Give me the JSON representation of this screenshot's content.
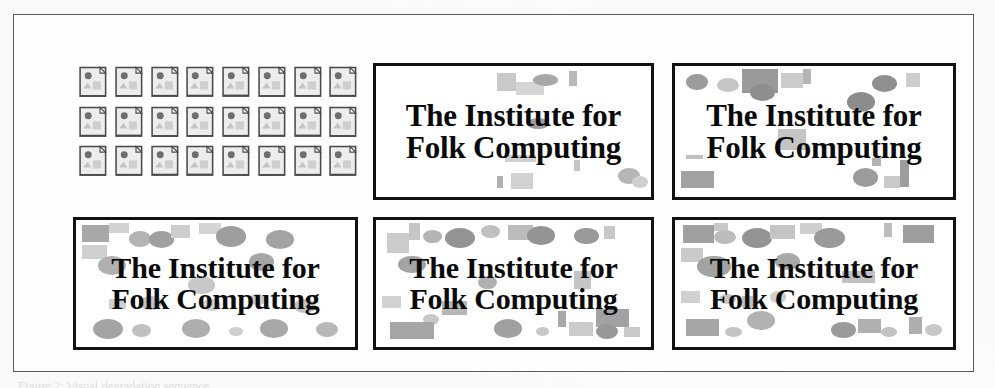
{
  "figure": {
    "caption": "Figure 2: Visual degradation sequence",
    "frame_color": "#5a5a5a",
    "page_background": "#fdfdfc"
  },
  "icon_grid": {
    "label": "image file icon grid",
    "icon_name": "image-document-icon",
    "columns": 8,
    "rows": 3,
    "count": 24,
    "icon_fill": "#ededed",
    "icon_outline": "#4a4a4a",
    "icon_accent": "#6e6e6e"
  },
  "posters": [
    {
      "id": "poster-a",
      "line1": "The Institute for",
      "line2": "Folk Computing",
      "noise_level": 1,
      "border_color": "#111111",
      "background": "#ffffff"
    },
    {
      "id": "poster-b",
      "line1": "The Institute for",
      "line2": "Folk Computing",
      "noise_level": 2,
      "border_color": "#111111",
      "background": "#ffffff"
    },
    {
      "id": "poster-c",
      "line1": "The Institute for",
      "line2": "Folk Computing",
      "noise_level": 3,
      "border_color": "#111111",
      "background": "#ffffff"
    },
    {
      "id": "poster-d",
      "line1": "The Institute for",
      "line2": "Folk Computing",
      "noise_level": 4,
      "border_color": "#111111",
      "background": "#ffffff"
    },
    {
      "id": "poster-e",
      "line1": "The Institute for",
      "line2": "Folk Computing",
      "noise_level": 5,
      "border_color": "#111111",
      "background": "#ffffff"
    }
  ],
  "noise_palette": {
    "light": "#d8d8d8",
    "medium": "#b4b4b4",
    "dark": "#9a9a9a",
    "darker": "#808080"
  },
  "noise_shapes": {
    "poster-a": [
      {
        "t": "sq",
        "x": 44,
        "y": 5,
        "w": 7,
        "h": 14,
        "c": "#c9c9c9"
      },
      {
        "t": "sq",
        "x": 51,
        "y": 12,
        "w": 10,
        "h": 10,
        "c": "#d5d5d5"
      },
      {
        "t": "ci",
        "x": 57,
        "y": 6,
        "w": 9,
        "h": 9,
        "c": "#a8a8a8"
      },
      {
        "t": "sq",
        "x": 70,
        "y": 4,
        "w": 3,
        "h": 11,
        "c": "#b9b9b9"
      },
      {
        "t": "ci",
        "x": 55,
        "y": 40,
        "w": 8,
        "h": 8,
        "c": "#9e9e9e"
      },
      {
        "t": "sq",
        "x": 47,
        "y": 68,
        "w": 11,
        "h": 5,
        "c": "#cfcfcf"
      },
      {
        "t": "sq",
        "x": 49,
        "y": 82,
        "w": 8,
        "h": 12,
        "c": "#d2d2d2"
      },
      {
        "t": "sq",
        "x": 44,
        "y": 84,
        "w": 2,
        "h": 9,
        "c": "#b0b0b0"
      },
      {
        "t": "ci",
        "x": 88,
        "y": 78,
        "w": 8,
        "h": 12,
        "c": "#b6b6b6"
      },
      {
        "t": "sq",
        "x": 72,
        "y": 72,
        "w": 2,
        "h": 8,
        "c": "#c4c4c4"
      },
      {
        "t": "ci",
        "x": 93,
        "y": 84,
        "w": 6,
        "h": 9,
        "c": "#d0d0d0"
      }
    ],
    "poster-b": [
      {
        "t": "ci",
        "x": 4,
        "y": 6,
        "w": 8,
        "h": 12,
        "c": "#9c9c9c"
      },
      {
        "t": "ci",
        "x": 15,
        "y": 9,
        "w": 8,
        "h": 11,
        "c": "#c6c6c6"
      },
      {
        "t": "sq",
        "x": 24,
        "y": 2,
        "w": 13,
        "h": 19,
        "c": "#9a9a9a"
      },
      {
        "t": "ci",
        "x": 27,
        "y": 14,
        "w": 9,
        "h": 13,
        "c": "#8e8e8e"
      },
      {
        "t": "sq",
        "x": 38,
        "y": 5,
        "w": 8,
        "h": 12,
        "c": "#cccccc"
      },
      {
        "t": "sq",
        "x": 46,
        "y": 2,
        "w": 3,
        "h": 12,
        "c": "#b4b4b4"
      },
      {
        "t": "ci",
        "x": 62,
        "y": 20,
        "w": 10,
        "h": 15,
        "c": "#8c8c8c"
      },
      {
        "t": "ci",
        "x": 71,
        "y": 7,
        "w": 9,
        "h": 13,
        "c": "#8f8f8f"
      },
      {
        "t": "sq",
        "x": 83,
        "y": 5,
        "w": 5,
        "h": 11,
        "c": "#cdcdcd"
      },
      {
        "t": "sq",
        "x": 37,
        "y": 48,
        "w": 10,
        "h": 16,
        "c": "#c4c4c4"
      },
      {
        "t": "sq",
        "x": 4,
        "y": 68,
        "w": 6,
        "h": 3,
        "c": "#c0c0c0"
      },
      {
        "t": "sq",
        "x": 2,
        "y": 80,
        "w": 12,
        "h": 13,
        "c": "#a2a2a2"
      },
      {
        "t": "ci",
        "x": 64,
        "y": 78,
        "w": 9,
        "h": 14,
        "c": "#9b9b9b"
      },
      {
        "t": "sq",
        "x": 75,
        "y": 84,
        "w": 6,
        "h": 9,
        "c": "#c9c9c9"
      },
      {
        "t": "sq",
        "x": 81,
        "y": 72,
        "w": 3,
        "h": 20,
        "c": "#9d9d9d"
      },
      {
        "t": "sq",
        "x": 71,
        "y": 70,
        "w": 3,
        "h": 6,
        "c": "#b2b2b2"
      }
    ],
    "poster-c": [
      {
        "t": "sq",
        "x": 2,
        "y": 4,
        "w": 10,
        "h": 13,
        "c": "#a8a8a8"
      },
      {
        "t": "sq",
        "x": 12,
        "y": 2,
        "w": 7,
        "h": 8,
        "c": "#d2d2d2"
      },
      {
        "t": "ci",
        "x": 19,
        "y": 9,
        "w": 8,
        "h": 12,
        "c": "#b4b4b4"
      },
      {
        "t": "ci",
        "x": 26,
        "y": 9,
        "w": 9,
        "h": 13,
        "c": "#a0a0a0"
      },
      {
        "t": "sq",
        "x": 34,
        "y": 4,
        "w": 7,
        "h": 10,
        "c": "#cdcdcd"
      },
      {
        "t": "sq",
        "x": 44,
        "y": 2,
        "w": 8,
        "h": 9,
        "c": "#d4d4d4"
      },
      {
        "t": "ci",
        "x": 50,
        "y": 5,
        "w": 11,
        "h": 16,
        "c": "#9e9e9e"
      },
      {
        "t": "ci",
        "x": 68,
        "y": 8,
        "w": 10,
        "h": 15,
        "c": "#a3a3a3"
      },
      {
        "t": "sq",
        "x": 2,
        "y": 20,
        "w": 9,
        "h": 11,
        "c": "#cfcfcf"
      },
      {
        "t": "ci",
        "x": 8,
        "y": 28,
        "w": 10,
        "h": 15,
        "c": "#b0b0b0"
      },
      {
        "t": "ci",
        "x": 62,
        "y": 26,
        "w": 9,
        "h": 14,
        "c": "#a6a6a6"
      },
      {
        "t": "ci",
        "x": 40,
        "y": 44,
        "w": 10,
        "h": 14,
        "c": "#c8c8c8"
      },
      {
        "t": "sq",
        "x": 12,
        "y": 62,
        "w": 6,
        "h": 8,
        "c": "#d0d0d0"
      },
      {
        "t": "ci",
        "x": 23,
        "y": 60,
        "w": 8,
        "h": 11,
        "c": "#c4c4c4"
      },
      {
        "t": "ci",
        "x": 45,
        "y": 62,
        "w": 7,
        "h": 10,
        "c": "#d2d2d2"
      },
      {
        "t": "ci",
        "x": 62,
        "y": 58,
        "w": 6,
        "h": 9,
        "c": "#cacaca"
      },
      {
        "t": "ci",
        "x": 78,
        "y": 62,
        "w": 8,
        "h": 11,
        "c": "#c2c2c2"
      },
      {
        "t": "ci",
        "x": 6,
        "y": 78,
        "w": 11,
        "h": 16,
        "c": "#a4a4a4"
      },
      {
        "t": "ci",
        "x": 20,
        "y": 82,
        "w": 7,
        "h": 10,
        "c": "#c0c0c0"
      },
      {
        "t": "ci",
        "x": 38,
        "y": 78,
        "w": 10,
        "h": 15,
        "c": "#aeaeae"
      },
      {
        "t": "ci",
        "x": 55,
        "y": 84,
        "w": 5,
        "h": 7,
        "c": "#cfcfcf"
      },
      {
        "t": "ci",
        "x": 66,
        "y": 78,
        "w": 10,
        "h": 15,
        "c": "#a8a8a8"
      },
      {
        "t": "ci",
        "x": 86,
        "y": 80,
        "w": 8,
        "h": 12,
        "c": "#b8b8b8"
      }
    ],
    "poster-d": [
      {
        "t": "sq",
        "x": 12,
        "y": 2,
        "w": 4,
        "h": 14,
        "c": "#c6c6c6"
      },
      {
        "t": "ci",
        "x": 17,
        "y": 8,
        "w": 7,
        "h": 10,
        "c": "#b4b4b4"
      },
      {
        "t": "sq",
        "x": 4,
        "y": 10,
        "w": 8,
        "h": 16,
        "c": "#cccccc"
      },
      {
        "t": "ci",
        "x": 25,
        "y": 6,
        "w": 11,
        "h": 16,
        "c": "#949494"
      },
      {
        "t": "ci",
        "x": 38,
        "y": 4,
        "w": 7,
        "h": 10,
        "c": "#c0c0c0"
      },
      {
        "t": "sq",
        "x": 48,
        "y": 4,
        "w": 9,
        "h": 12,
        "c": "#bcbcbc"
      },
      {
        "t": "ci",
        "x": 55,
        "y": 5,
        "w": 10,
        "h": 15,
        "c": "#949494"
      },
      {
        "t": "ci",
        "x": 72,
        "y": 6,
        "w": 9,
        "h": 13,
        "c": "#9a9a9a"
      },
      {
        "t": "sq",
        "x": 83,
        "y": 5,
        "w": 4,
        "h": 10,
        "c": "#c8c8c8"
      },
      {
        "t": "ci",
        "x": 8,
        "y": 28,
        "w": 10,
        "h": 14,
        "c": "#a4a4a4"
      },
      {
        "t": "ci",
        "x": 37,
        "y": 44,
        "w": 7,
        "h": 10,
        "c": "#b0b0b0"
      },
      {
        "t": "sq",
        "x": 72,
        "y": 40,
        "w": 6,
        "h": 14,
        "c": "#c4c4c4"
      },
      {
        "t": "sq",
        "x": 2,
        "y": 60,
        "w": 7,
        "h": 9,
        "c": "#d2d2d2"
      },
      {
        "t": "sq",
        "x": 24,
        "y": 64,
        "w": 9,
        "h": 11,
        "c": "#b6b6b6"
      },
      {
        "t": "ci",
        "x": 17,
        "y": 74,
        "w": 6,
        "h": 9,
        "c": "#c8c8c8"
      },
      {
        "t": "sq",
        "x": 5,
        "y": 80,
        "w": 16,
        "h": 14,
        "c": "#a6a6a6"
      },
      {
        "t": "ci",
        "x": 43,
        "y": 78,
        "w": 10,
        "h": 15,
        "c": "#a0a0a0"
      },
      {
        "t": "ci",
        "x": 58,
        "y": 84,
        "w": 5,
        "h": 7,
        "c": "#c8c8c8"
      },
      {
        "t": "sq",
        "x": 66,
        "y": 72,
        "w": 3,
        "h": 12,
        "c": "#a8a8a8"
      },
      {
        "t": "sq",
        "x": 70,
        "y": 80,
        "w": 9,
        "h": 11,
        "c": "#cbcbcb"
      },
      {
        "t": "sq",
        "x": 80,
        "y": 70,
        "w": 12,
        "h": 14,
        "c": "#a2a2a2"
      },
      {
        "t": "ci",
        "x": 80,
        "y": 82,
        "w": 8,
        "h": 12,
        "c": "#989898"
      },
      {
        "t": "sq",
        "x": 90,
        "y": 84,
        "w": 6,
        "h": 8,
        "c": "#cacaca"
      }
    ],
    "poster-e": [
      {
        "t": "sq",
        "x": 3,
        "y": 4,
        "w": 11,
        "h": 14,
        "c": "#a0a0a0"
      },
      {
        "t": "sq",
        "x": 14,
        "y": 2,
        "w": 5,
        "h": 7,
        "c": "#c8c8c8"
      },
      {
        "t": "ci",
        "x": 14,
        "y": 8,
        "w": 8,
        "h": 11,
        "c": "#bcbcbc"
      },
      {
        "t": "ci",
        "x": 24,
        "y": 6,
        "w": 11,
        "h": 16,
        "c": "#949494"
      },
      {
        "t": "sq",
        "x": 34,
        "y": 4,
        "w": 9,
        "h": 11,
        "c": "#c4c4c4"
      },
      {
        "t": "sq",
        "x": 45,
        "y": 2,
        "w": 8,
        "h": 9,
        "c": "#cecece"
      },
      {
        "t": "ci",
        "x": 50,
        "y": 6,
        "w": 11,
        "h": 16,
        "c": "#9a9a9a"
      },
      {
        "t": "sq",
        "x": 75,
        "y": 2,
        "w": 3,
        "h": 11,
        "c": "#bcbcbc"
      },
      {
        "t": "sq",
        "x": 82,
        "y": 4,
        "w": 11,
        "h": 14,
        "c": "#9e9e9e"
      },
      {
        "t": "sq",
        "x": 2,
        "y": 22,
        "w": 8,
        "h": 11,
        "c": "#cacaca"
      },
      {
        "t": "ci",
        "x": 8,
        "y": 28,
        "w": 12,
        "h": 17,
        "c": "#a2a2a2"
      },
      {
        "t": "ci",
        "x": 36,
        "y": 26,
        "w": 9,
        "h": 13,
        "c": "#a8a8a8"
      },
      {
        "t": "sq",
        "x": 60,
        "y": 40,
        "w": 12,
        "h": 10,
        "c": "#c0c0c0"
      },
      {
        "t": "sq",
        "x": 2,
        "y": 56,
        "w": 7,
        "h": 9,
        "c": "#d0d0d0"
      },
      {
        "t": "ci",
        "x": 16,
        "y": 58,
        "w": 6,
        "h": 8,
        "c": "#c6c6c6"
      },
      {
        "t": "sq",
        "x": 24,
        "y": 60,
        "w": 4,
        "h": 9,
        "c": "#c0c0c0"
      },
      {
        "t": "ci",
        "x": 34,
        "y": 56,
        "w": 6,
        "h": 9,
        "c": "#cecece"
      },
      {
        "t": "ci",
        "x": 26,
        "y": 72,
        "w": 10,
        "h": 15,
        "c": "#b2b2b2"
      },
      {
        "t": "sq",
        "x": 4,
        "y": 78,
        "w": 12,
        "h": 13,
        "c": "#a6a6a6"
      },
      {
        "t": "ci",
        "x": 18,
        "y": 84,
        "w": 6,
        "h": 8,
        "c": "#c4c4c4"
      },
      {
        "t": "ci",
        "x": 56,
        "y": 80,
        "w": 9,
        "h": 13,
        "c": "#9a9a9a"
      },
      {
        "t": "sq",
        "x": 66,
        "y": 78,
        "w": 8,
        "h": 11,
        "c": "#b0b0b0"
      },
      {
        "t": "ci",
        "x": 74,
        "y": 84,
        "w": 6,
        "h": 8,
        "c": "#c2c2c2"
      },
      {
        "t": "sq",
        "x": 84,
        "y": 76,
        "w": 5,
        "h": 14,
        "c": "#aeaeae"
      },
      {
        "t": "ci",
        "x": 90,
        "y": 82,
        "w": 6,
        "h": 9,
        "c": "#c8c8c8"
      }
    ]
  }
}
